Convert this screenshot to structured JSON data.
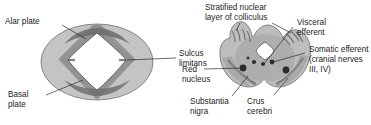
{
  "figure": {
    "background_color": "#ffffff",
    "text_color": "#1c1c1c",
    "leader_line_color": "#2b2b2b",
    "panels": [
      {
        "id": "left-panel",
        "name": "neural-tube-cross-section",
        "shape": "oval-with-diamond-lumen",
        "fill_color": "#bfbfbf",
        "inner_band_color": "#8f8f8f",
        "lumen_color": "#ffffff",
        "labels": [
          {
            "id": "alar-plate",
            "text_lines": [
              "Alar plate"
            ]
          },
          {
            "id": "sulcus-limitans",
            "text_lines": [
              "Sulcus",
              "limitans"
            ]
          },
          {
            "id": "basal-plate",
            "text_lines": [
              "Basal",
              "plate"
            ]
          }
        ]
      },
      {
        "id": "right-panel",
        "name": "midbrain-cross-section",
        "shape": "midbrain-butterfly",
        "fill_color": "#b8b8b8",
        "shading_color": "#9a9a9a",
        "nucleus_color": "#2e2e2e",
        "aqueduct_color": "#ffffff",
        "labels": [
          {
            "id": "stratified-nuclear-layer",
            "text_lines": [
              "Stratified nuclear",
              "layer of colliculus"
            ]
          },
          {
            "id": "visceral-efferent",
            "text_lines": [
              "Visceral",
              "efferent"
            ]
          },
          {
            "id": "somatic-efferent",
            "text_lines": [
              "Somatic efferent",
              "(cranial nerves",
              "III, IV)"
            ]
          },
          {
            "id": "red-nucleus",
            "text_lines": [
              "Red",
              "nucleus"
            ]
          },
          {
            "id": "substantia-nigra",
            "text_lines": [
              "Substantia",
              "nigra"
            ]
          },
          {
            "id": "crus-cerebri",
            "text_lines": [
              "Crus",
              "cerebri"
            ]
          }
        ]
      }
    ]
  },
  "labels": {
    "alar_plate": "Alar plate",
    "sulcus_limitans_1": "Sulcus",
    "sulcus_limitans_2": "limitans",
    "basal_plate_1": "Basal",
    "basal_plate_2": "plate",
    "stratified_1": "Stratified nuclear",
    "stratified_2": "layer of colliculus",
    "visceral_1": "Visceral",
    "visceral_2": "efferent",
    "somatic_1": "Somatic efferent",
    "somatic_2": "(cranial nerves",
    "somatic_3": "III, IV)",
    "red_nucleus_1": "Red",
    "red_nucleus_2": "nucleus",
    "substantia_1": "Substantia",
    "substantia_2": "nigra",
    "crus_1": "Crus",
    "crus_2": "cerebri"
  }
}
